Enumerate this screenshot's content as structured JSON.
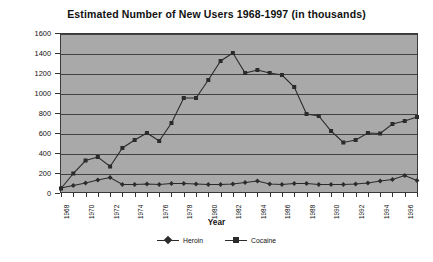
{
  "chart_data": {
    "type": "line",
    "title": "Estimated Number of New Users  1968-1997 (in thousands)",
    "xlabel": "Year",
    "ylabel": "Number of New Users (000)",
    "ylim": [
      0,
      1600
    ],
    "ytick_step": 200,
    "yticks": [
      "0",
      "200",
      "400",
      "600",
      "800",
      "1000",
      "1200",
      "1400",
      "1600"
    ],
    "grid": true,
    "legend_position": "bottom-center",
    "x": [
      1968,
      1969,
      1970,
      1971,
      1972,
      1973,
      1974,
      1975,
      1976,
      1977,
      1978,
      1979,
      1980,
      1981,
      1982,
      1983,
      1984,
      1985,
      1986,
      1987,
      1988,
      1989,
      1990,
      1991,
      1992,
      1993,
      1994,
      1995,
      1996,
      1997
    ],
    "xticklabels": [
      "1968",
      "1970",
      "1972",
      "1974",
      "1976",
      "1978",
      "1980",
      "1982",
      "1984",
      "1986",
      "1988",
      "1990",
      "1992",
      "1994",
      "1996"
    ],
    "xtick_every": 2,
    "series": [
      {
        "name": "Heroin",
        "marker": "diamond",
        "color": "#2b2b2b",
        "values": [
          50,
          75,
          100,
          130,
          155,
          85,
          85,
          90,
          85,
          95,
          95,
          90,
          85,
          85,
          90,
          105,
          120,
          90,
          85,
          95,
          95,
          85,
          85,
          85,
          90,
          100,
          120,
          135,
          175,
          125
        ]
      },
      {
        "name": "Cocaine",
        "marker": "square",
        "color": "#2b2b2b",
        "values": [
          45,
          195,
          325,
          360,
          265,
          450,
          530,
          600,
          520,
          700,
          950,
          950,
          1130,
          1320,
          1400,
          1200,
          1230,
          1200,
          1180,
          1060,
          790,
          770,
          620,
          505,
          530,
          600,
          595,
          690,
          720,
          760
        ]
      }
    ]
  },
  "legend": {
    "items": [
      {
        "label": "Heroin"
      },
      {
        "label": "Cocaine"
      }
    ]
  }
}
